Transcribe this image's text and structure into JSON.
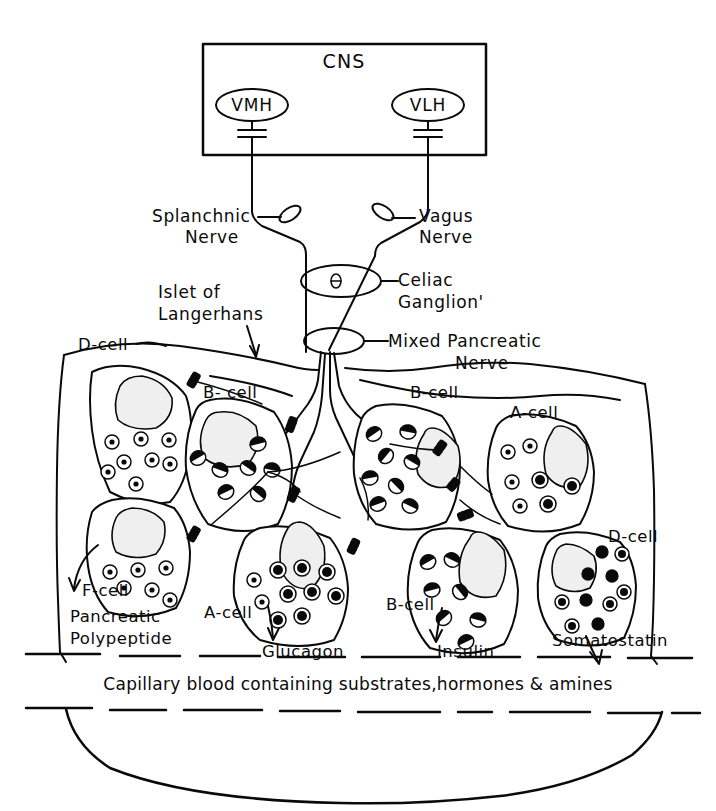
{
  "figure": {
    "background_color": "#ffffff",
    "ink_color": "#0a0a0a"
  },
  "cns": {
    "box_label": "CNS",
    "nuclei": [
      {
        "id": "vmh",
        "label": "VMH"
      },
      {
        "id": "vlh",
        "label": "VLH"
      }
    ]
  },
  "nerves": {
    "splanchnic": {
      "label_line1": "Splanchnic",
      "label_line2": "Nerve"
    },
    "vagus": {
      "label_line1": "Vagus",
      "label_line2": "Nerve"
    },
    "celiac_ganglion": {
      "label_line1": "Celiac",
      "label_line2": "Ganglion'"
    },
    "mixed_pancreatic": {
      "label_line1": "Mixed Pancreatic",
      "label_line2": "Nerve"
    }
  },
  "islet": {
    "label_line1": "Islet of",
    "label_line2": "Langerhans"
  },
  "cell_labels": [
    {
      "id": "d-cell-left",
      "text": "D-cell"
    },
    {
      "id": "b-cell-left",
      "text": "B- cell"
    },
    {
      "id": "b-cell-right",
      "text": "B-cell"
    },
    {
      "id": "a-cell-right",
      "text": "A-cell"
    },
    {
      "id": "d-cell-right",
      "text": "D-cell"
    },
    {
      "id": "f-cell",
      "text": "F-cell"
    },
    {
      "id": "a-cell-center",
      "text": "A-cell"
    },
    {
      "id": "b-cell-lower",
      "text": "B-cell"
    }
  ],
  "hormones": [
    {
      "id": "pancreatic-polypeptide",
      "line1": "Pancreatic",
      "line2": "Polypeptide",
      "cell": "F-cell"
    },
    {
      "id": "glucagon",
      "line1": "Glucagon",
      "line2": "",
      "cell": "A-cell"
    },
    {
      "id": "insulin",
      "line1": "Insulin",
      "line2": "",
      "cell": "B-cell"
    },
    {
      "id": "somatostatin",
      "line1": "Somatostatin",
      "line2": "",
      "cell": "D-cell"
    }
  ],
  "capillary": {
    "caption": "Capillary blood containing substrates,hormones & amines"
  }
}
